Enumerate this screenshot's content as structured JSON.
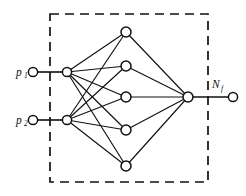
{
  "figure": {
    "background_color": "#ffffff",
    "ink_color": "#111111"
  },
  "boundary": {
    "name": "network-boundary",
    "style": "dashed",
    "x": 50,
    "y": 14,
    "width": 158,
    "height": 168
  },
  "labels": {
    "input_1": {
      "base": "p",
      "sub": "1"
    },
    "input_2": {
      "base": "p",
      "sub": "2"
    },
    "output": {
      "base": "N",
      "sub": "f"
    }
  },
  "nodes": {
    "input_terminals": [
      {
        "name": "input-terminal-1",
        "cx": 33,
        "cy": 72,
        "r": 4.6
      },
      {
        "name": "input-terminal-2",
        "cx": 33,
        "cy": 120,
        "r": 4.6
      }
    ],
    "input_layer": [
      {
        "name": "input-node-1",
        "cx": 67,
        "cy": 72,
        "r": 4.6
      },
      {
        "name": "input-node-2",
        "cx": 67,
        "cy": 120,
        "r": 4.6
      }
    ],
    "hidden_layer": [
      {
        "name": "hidden-node-1",
        "cx": 126,
        "cy": 32,
        "r": 5.0
      },
      {
        "name": "hidden-node-2",
        "cx": 126,
        "cy": 66,
        "r": 5.0
      },
      {
        "name": "hidden-node-3",
        "cx": 126,
        "cy": 97,
        "r": 5.0
      },
      {
        "name": "hidden-node-4",
        "cx": 126,
        "cy": 130,
        "r": 5.0
      },
      {
        "name": "hidden-node-5",
        "cx": 126,
        "cy": 166,
        "r": 5.0
      }
    ],
    "output_layer": [
      {
        "name": "output-node",
        "cx": 188,
        "cy": 97,
        "r": 5.0
      }
    ],
    "output_terminals": [
      {
        "name": "output-terminal",
        "cx": 233,
        "cy": 97,
        "r": 4.6
      }
    ]
  },
  "edges": {
    "leads": [
      {
        "name": "lead-input-1",
        "x1": 37,
        "y1": 72,
        "x2": 63,
        "y2": 72
      },
      {
        "name": "lead-input-2",
        "x1": 37,
        "y1": 120,
        "x2": 63,
        "y2": 120
      },
      {
        "name": "lead-output",
        "x1": 192,
        "y1": 97,
        "x2": 229,
        "y2": 97
      }
    ],
    "input_to_hidden": [
      {
        "name": "edge-i1-h1",
        "from": [
          67,
          72
        ],
        "to": [
          126,
          32
        ]
      },
      {
        "name": "edge-i1-h2",
        "from": [
          67,
          72
        ],
        "to": [
          126,
          66
        ]
      },
      {
        "name": "edge-i1-h3",
        "from": [
          67,
          72
        ],
        "to": [
          126,
          97
        ]
      },
      {
        "name": "edge-i1-h4",
        "from": [
          67,
          72
        ],
        "to": [
          126,
          130
        ]
      },
      {
        "name": "edge-i1-h5",
        "from": [
          67,
          72
        ],
        "to": [
          126,
          166
        ]
      },
      {
        "name": "edge-i2-h1",
        "from": [
          67,
          120
        ],
        "to": [
          126,
          32
        ]
      },
      {
        "name": "edge-i2-h2",
        "from": [
          67,
          120
        ],
        "to": [
          126,
          66
        ]
      },
      {
        "name": "edge-i2-h3",
        "from": [
          67,
          120
        ],
        "to": [
          126,
          97
        ]
      },
      {
        "name": "edge-i2-h4",
        "from": [
          67,
          120
        ],
        "to": [
          126,
          130
        ]
      },
      {
        "name": "edge-i2-h5",
        "from": [
          67,
          120
        ],
        "to": [
          126,
          166
        ]
      }
    ],
    "hidden_to_output": [
      {
        "name": "edge-h1-o",
        "from": [
          126,
          32
        ],
        "to": [
          188,
          97
        ]
      },
      {
        "name": "edge-h2-o",
        "from": [
          126,
          66
        ],
        "to": [
          188,
          97
        ]
      },
      {
        "name": "edge-h3-o",
        "from": [
          126,
          97
        ],
        "to": [
          188,
          97
        ]
      },
      {
        "name": "edge-h4-o",
        "from": [
          126,
          130
        ],
        "to": [
          188,
          97
        ]
      },
      {
        "name": "edge-h5-o",
        "from": [
          126,
          166
        ],
        "to": [
          188,
          97
        ]
      }
    ]
  }
}
